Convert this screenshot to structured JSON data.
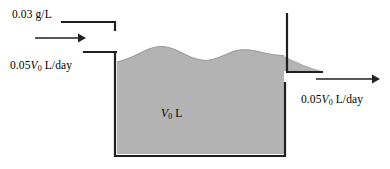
{
  "figure": {
    "name": "mixing-tank-diagram",
    "width": 390,
    "height": 169,
    "background": "#ffffff",
    "stroke_color": "#231f20",
    "water_fill": "#b3b3b3",
    "water_edge": "#999999"
  },
  "labels": {
    "inflow_concentration": {
      "text": "0.03 g/L",
      "value": "0.03",
      "unit": "g/L"
    },
    "inflow_rate": {
      "prefix": "0.05",
      "variable": "V",
      "subscript": "0",
      "unit": " L/day",
      "text": "0.05V0 L/day"
    },
    "tank_volume": {
      "variable": "V",
      "subscript": "0",
      "unit": " L",
      "text": "V0 L"
    },
    "outflow_rate": {
      "prefix": "0.05",
      "variable": "V",
      "subscript": "0",
      "unit": " L/day",
      "text": "0.05V0 L/day"
    }
  },
  "arrows": {
    "inflow": {
      "name": "inflow-arrow",
      "direction": "right"
    },
    "outflow": {
      "name": "outflow-arrow",
      "direction": "right"
    }
  }
}
